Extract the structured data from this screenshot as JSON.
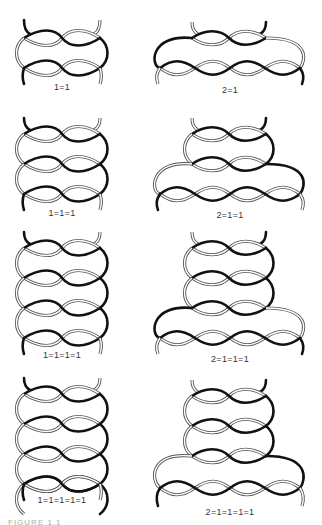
{
  "figure": {
    "caption": "FIGURE 1.1",
    "diagrams": [
      {
        "id": "a1",
        "label": "1=1",
        "column": "left",
        "loops": 1
      },
      {
        "id": "b1",
        "label": "2=1",
        "column": "right",
        "loops": 1
      },
      {
        "id": "a2",
        "label": "1=1=1",
        "column": "left",
        "loops": 2
      },
      {
        "id": "b2",
        "label": "2=1=1",
        "column": "right",
        "loops": 2
      },
      {
        "id": "a3",
        "label": "1=1=1=1",
        "column": "left",
        "loops": 3
      },
      {
        "id": "b3",
        "label": "2=1=1=1",
        "column": "right",
        "loops": 3
      },
      {
        "id": "a4",
        "label": "1=1=1=1=1",
        "column": "left",
        "loops": 4
      },
      {
        "id": "b4",
        "label": "2=1=1=1=1",
        "column": "right",
        "loops": 4
      }
    ]
  }
}
